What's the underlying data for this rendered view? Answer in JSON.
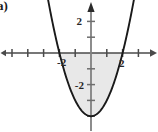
{
  "figure": {
    "part_label": "a)",
    "background_color": "#ffffff",
    "axis_color": "#4a4a4a",
    "curve_color": "#1a1a1a",
    "shade_color": "#e8e8e8",
    "tick_label_color": "#262626"
  },
  "axes": {
    "x_axis_label": "",
    "y_axis_label": "",
    "origin_px": {
      "x": 91,
      "y": 53
    },
    "unit_px": 15.8,
    "x_range": [
      -5.7,
      4.2
    ],
    "y_range": [
      -5.0,
      3.2
    ],
    "x_ticks": [
      -5,
      -4,
      -3,
      -2,
      -1,
      1,
      2,
      3,
      4
    ],
    "y_ticks": [
      -4,
      -3,
      -2,
      -1,
      1,
      2
    ],
    "x_tick_labels": [
      {
        "value": -2,
        "text": "-2"
      },
      {
        "value": 2,
        "text": "2"
      }
    ],
    "y_tick_labels": [
      {
        "value": 2,
        "text": "2"
      },
      {
        "value": -2,
        "text": "-2"
      }
    ],
    "arrows": [
      "x-positive",
      "y-positive",
      "x-negative"
    ]
  },
  "chart_data": {
    "type": "line",
    "title": "",
    "xlabel": "",
    "ylabel": "",
    "xlim": [
      -5.7,
      4.2
    ],
    "ylim": [
      -5.0,
      3.2
    ],
    "grid": false,
    "legend": "none",
    "annotations": [
      "a)"
    ],
    "series": [
      {
        "name": "y = x^2 - 4",
        "equation": "y = x^2 - 4",
        "roots": [
          -2,
          2
        ],
        "vertex": [
          0,
          -4
        ],
        "x": [
          -2.75,
          -2.5,
          -2.25,
          -2.0,
          -1.75,
          -1.5,
          -1.25,
          -1.0,
          -0.75,
          -0.5,
          -0.25,
          0,
          0.25,
          0.5,
          0.75,
          1.0,
          1.25,
          1.5,
          1.75,
          2.0,
          2.25,
          2.5,
          2.75
        ],
        "values": [
          3.5625,
          2.25,
          1.0625,
          0,
          -0.9375,
          -1.75,
          -2.4375,
          -3,
          -3.4375,
          -3.75,
          -3.9375,
          -4,
          -3.9375,
          -3.75,
          -3.4375,
          -3,
          -2.4375,
          -1.75,
          -0.9375,
          0,
          1.0625,
          2.25,
          3.5625
        ]
      }
    ],
    "shaded_region": {
      "label": "area between curve and x-axis",
      "x_from": -2,
      "x_to": 2,
      "upper": "y = 0",
      "lower": "y = x^2 - 4",
      "fill": "#e8e8e8"
    }
  }
}
